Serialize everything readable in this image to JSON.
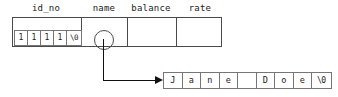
{
  "diagram": {
    "colors": {
      "outline": "#4a4a4a",
      "cell_outline": "#767676",
      "arrow": "#111111",
      "text": "#1a1a1a",
      "background": "#ffffff"
    },
    "struct_fields": [
      {
        "name": "id_no",
        "label": "id_no",
        "kind": "char-array"
      },
      {
        "name": "name",
        "label": "name",
        "kind": "pointer"
      },
      {
        "name": "balance",
        "label": "balance",
        "kind": "empty"
      },
      {
        "name": "rate",
        "label": "rate",
        "kind": "empty"
      }
    ],
    "id_no_cells": [
      "1",
      "1",
      "1",
      "1",
      "\\0"
    ],
    "name_string_cells": [
      "J",
      "a",
      "n",
      "e",
      " ",
      "D",
      "o",
      "e",
      "\\0"
    ],
    "pointer": {
      "from_field": "name",
      "to_array": "name_string_cells",
      "glyph": "pointer-dot-circle"
    }
  }
}
